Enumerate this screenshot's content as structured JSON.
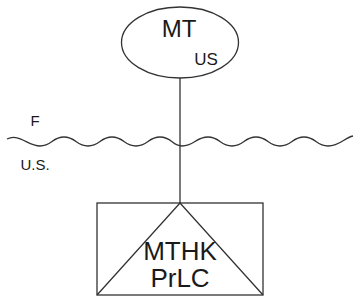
{
  "diagram": {
    "top_node": {
      "shape": "ellipse",
      "title": "MT",
      "subtitle": "US"
    },
    "boundary": {
      "shape": "wavy-line",
      "label_above": "F",
      "label_below": "U.S."
    },
    "bottom_node": {
      "shape": "rectangle-with-triangle",
      "line1": "MTHK",
      "line2": "PrLC"
    },
    "connector": {
      "from": "MT",
      "to": "MTHK PrLC"
    },
    "colors": {
      "stroke": "#333333",
      "text": "#1a1a1a",
      "background": "#ffffff"
    }
  }
}
